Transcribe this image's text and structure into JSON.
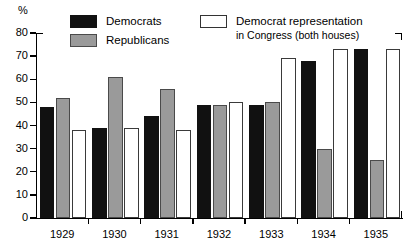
{
  "chart_data": {
    "type": "bar",
    "title": "",
    "subtitle": "",
    "xlabel": "",
    "ylabel": "%",
    "ylim": [
      0,
      80
    ],
    "ytick_step": 10,
    "yticks": [
      0,
      10,
      20,
      30,
      40,
      50,
      60,
      70,
      80
    ],
    "grid": false,
    "legend_position": "top",
    "categories": [
      "1929",
      "1930",
      "1931",
      "1932",
      "1933",
      "1934",
      "1935"
    ],
    "series": [
      {
        "name": "Democrats",
        "color": "#111111",
        "values": [
          48,
          39,
          44,
          49,
          49,
          68,
          73
        ]
      },
      {
        "name": "Republicans",
        "color": "#9a9a9a",
        "values": [
          52,
          61,
          56,
          49,
          50,
          30,
          25
        ]
      },
      {
        "name": "Democrat representation in Congress (both houses)",
        "color": "#ffffff",
        "values": [
          38,
          39,
          38,
          50,
          69,
          73,
          73
        ]
      }
    ]
  },
  "axis": {
    "unit_label": "%",
    "y_labels": [
      "80",
      "70",
      "60",
      "50",
      "40",
      "30",
      "20",
      "10",
      "0"
    ],
    "x_labels": [
      "1929",
      "1930",
      "1931",
      "1932",
      "1933",
      "1934",
      "1935"
    ]
  },
  "legend": {
    "democrats_label": "Democrats",
    "republicans_label": "Republicans",
    "congress_label_line1": "Democrat representation",
    "congress_label_line2": "in Congress (both houses)"
  }
}
